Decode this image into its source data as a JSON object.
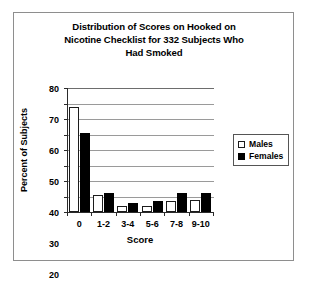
{
  "chart_data": {
    "type": "bar",
    "title": "Distribution of Scores on Hooked on Nicotine Checklist for 332 Subjects Who Had Smoked",
    "title_lines": [
      "Distribution of Scores on Hooked on",
      "Nicotine Checklist for 332 Subjects Who",
      "Had Smoked"
    ],
    "xlabel": "Score",
    "ylabel": "Percent of Subjects",
    "categories": [
      "0",
      "1-2",
      "3-4",
      "5-6",
      "7-8",
      "9-10"
    ],
    "series": [
      {
        "name": "Males",
        "color": "#ffffff",
        "edge_color": "#1c1c1c",
        "values": [
          68,
          11,
          4,
          4,
          7,
          8
        ]
      },
      {
        "name": "Females",
        "color": "#000000",
        "edge_color": "#000000",
        "values": [
          51,
          12,
          6,
          7,
          12,
          12
        ]
      }
    ],
    "ylim": [
      0,
      80
    ],
    "yticks": [
      0,
      10,
      20,
      30,
      40,
      50,
      60,
      70,
      80
    ],
    "ytick_labels": [
      "0",
      "10",
      "20",
      "30",
      "40",
      "50",
      "60",
      "70",
      "80"
    ],
    "grid": true,
    "grid_axis": "y",
    "legend": [
      "Males",
      "Females"
    ],
    "legend_position": "right",
    "background": "#ffffff",
    "frame": true
  }
}
